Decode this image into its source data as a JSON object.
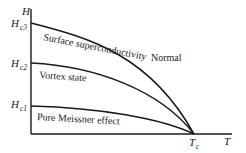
{
  "diagram": {
    "title": "",
    "axes": {
      "y_label": "H",
      "x_label": "T"
    },
    "markers": {
      "hc3": {
        "base": "H",
        "sub": "c3"
      },
      "hc2": {
        "base": "H",
        "sub": "c2"
      },
      "hc1": {
        "base": "H",
        "sub": "c1"
      },
      "tc": {
        "base": "T",
        "sub": "c"
      }
    },
    "regions": {
      "surface": "Surface superconductivity",
      "vortex": "Vortex state",
      "meissner": "Pure Meissner effect",
      "normal": "Normal"
    },
    "curves": [
      {
        "name": "Hc3",
        "from": "Hc3",
        "to": "Tc"
      },
      {
        "name": "Hc2",
        "from": "Hc2",
        "to": "Tc"
      },
      {
        "name": "Hc1",
        "from": "Hc1",
        "to": "Tc"
      }
    ],
    "colors": {
      "ink": "#1a1a1a",
      "background": "#ffffff"
    }
  }
}
